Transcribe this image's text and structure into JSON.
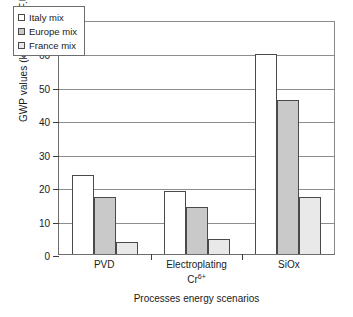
{
  "chart_data": {
    "type": "bar",
    "title": "",
    "subtitle": "",
    "xlabel": "Processes energy scenarios",
    "ylabel": "GWP values (kg CO2 eq/F.U)",
    "ylabel_parts": {
      "prefix": "GWP values (kg CO",
      "sub": "2",
      "suffix": " eq/F.U)"
    },
    "categories": [
      "PVD",
      "Electroplating Cr6+",
      "SiOx"
    ],
    "category_labels": [
      {
        "line1": "PVD",
        "line2": "",
        "line2_sup": ""
      },
      {
        "line1": "Electroplating",
        "line2": "Cr",
        "line2_sup": "6+"
      },
      {
        "line1": "SiOx",
        "line2": "",
        "line2_sup": ""
      }
    ],
    "series": [
      {
        "name": "Italy mix",
        "color": "#ffffff",
        "values": [
          23.5,
          18.8,
          59.7
        ]
      },
      {
        "name": "Europe mix",
        "color": "#c9c9c9",
        "values": [
          17.0,
          14.2,
          46.0
        ]
      },
      {
        "name": "France mix",
        "color": "#e9e9e9",
        "values": [
          3.7,
          4.5,
          17.0
        ]
      }
    ],
    "ylim": [
      0,
      70
    ],
    "yticks": [
      0,
      10,
      20,
      30,
      40,
      50,
      60,
      70
    ],
    "ytick_labels": [
      "0",
      "10",
      "20",
      "30",
      "40",
      "50",
      "60",
      "70"
    ],
    "grid": true,
    "grid_axis": "y",
    "legend_position": "upper-left-inside",
    "bar_edge_color": "#4a4a4a",
    "axis_color": "#3d3d3d",
    "grid_color": "#8d8d8d",
    "background": "#ffffff"
  }
}
